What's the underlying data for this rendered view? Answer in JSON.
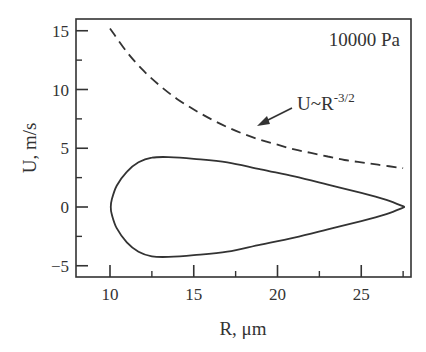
{
  "chart_data": {
    "type": "line",
    "title": "",
    "xlabel": "R, μm",
    "ylabel": "U, m/s",
    "xlim": [
      8,
      28
    ],
    "ylim": [
      -5.8,
      16.2
    ],
    "xticks": [
      10,
      15,
      20,
      25
    ],
    "xticks_minor": [
      12.5,
      17.5,
      22.5,
      27.5
    ],
    "yticks": [
      -5,
      0,
      5,
      10,
      15
    ],
    "yticks_minor": [
      -2.5,
      2.5,
      7.5,
      12.5
    ],
    "grid": false,
    "legend": null,
    "annotations": [
      {
        "text": "10000 Pa",
        "position": "top-right"
      },
      {
        "text": "U~R",
        "superscript": "-3/2",
        "arrow_to": {
          "x": 17,
          "y": 6.8
        }
      }
    ],
    "series": [
      {
        "name": "closed-trajectory",
        "style": "solid",
        "points": [
          [
            27.6,
            0.0
          ],
          [
            26.5,
            0.6
          ],
          [
            25.0,
            1.2
          ],
          [
            23.0,
            1.9
          ],
          [
            21.0,
            2.6
          ],
          [
            19.0,
            3.2
          ],
          [
            17.0,
            3.8
          ],
          [
            15.0,
            4.1
          ],
          [
            13.5,
            4.25
          ],
          [
            12.5,
            4.2
          ],
          [
            11.7,
            3.8
          ],
          [
            11.0,
            3.0
          ],
          [
            10.4,
            1.8
          ],
          [
            10.1,
            0.6
          ],
          [
            10.05,
            0.0
          ],
          [
            10.1,
            -0.6
          ],
          [
            10.4,
            -1.8
          ],
          [
            11.0,
            -3.0
          ],
          [
            11.7,
            -3.8
          ],
          [
            12.5,
            -4.2
          ],
          [
            13.5,
            -4.25
          ],
          [
            15.0,
            -4.1
          ],
          [
            17.0,
            -3.8
          ],
          [
            19.0,
            -3.2
          ],
          [
            21.0,
            -2.6
          ],
          [
            23.0,
            -1.9
          ],
          [
            25.0,
            -1.2
          ],
          [
            26.5,
            -0.6
          ],
          [
            27.6,
            0.0
          ]
        ]
      },
      {
        "name": "U~R^-3/2",
        "style": "dashed",
        "points": [
          [
            10.0,
            15.2
          ],
          [
            11.0,
            13.2
          ],
          [
            12.0,
            11.6
          ],
          [
            13.0,
            10.3
          ],
          [
            14.0,
            9.2
          ],
          [
            15.0,
            8.3
          ],
          [
            16.0,
            7.5
          ],
          [
            17.0,
            6.8
          ],
          [
            18.0,
            6.2
          ],
          [
            19.0,
            5.7
          ],
          [
            20.0,
            5.3
          ],
          [
            21.0,
            4.9
          ],
          [
            22.0,
            4.6
          ],
          [
            23.0,
            4.3
          ],
          [
            24.0,
            4.0
          ],
          [
            25.0,
            3.8
          ],
          [
            26.0,
            3.6
          ],
          [
            27.5,
            3.3
          ]
        ]
      }
    ]
  }
}
